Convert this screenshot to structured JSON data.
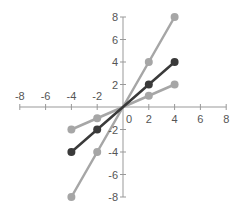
{
  "chart_data": {
    "type": "line",
    "title": "",
    "xlabel": "",
    "ylabel": "",
    "xlim": [
      -8,
      8
    ],
    "ylim": [
      -8,
      8
    ],
    "grid": false,
    "legend": null,
    "x_ticks": [
      -8,
      -6,
      -4,
      -2,
      2,
      4,
      6,
      8
    ],
    "y_ticks": [
      -8,
      -6,
      -4,
      -2,
      2,
      4,
      6,
      8
    ],
    "origin_label": "0",
    "x": [
      -4,
      -2,
      0,
      2,
      4
    ],
    "series": [
      {
        "name": "y = 2x",
        "values": [
          -8,
          -4,
          0,
          4,
          8
        ],
        "color": "#a6a6a6"
      },
      {
        "name": "y = x",
        "values": [
          -4,
          -2,
          0,
          2,
          4
        ],
        "color": "#3a3a3a"
      },
      {
        "name": "y = 0.5x",
        "values": [
          -2,
          -1,
          0,
          1,
          2
        ],
        "color": "#a6a6a6"
      }
    ]
  },
  "colors": {
    "axis": "#999999",
    "tick_label": "#555555"
  }
}
